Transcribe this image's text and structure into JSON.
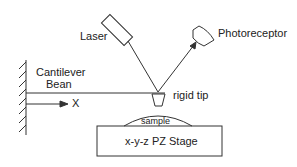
{
  "diagram": {
    "type": "Atomic force microscope schematic",
    "labels": {
      "laser": "Laser",
      "photoreceptor": "Photoreceptor",
      "cantilever_line1": "Cantilever",
      "cantilever_line2": "Bean",
      "x_axis": "X",
      "rigid_tip": "rigid tip",
      "sample": "sample",
      "stage": "x-y-z PZ Stage"
    },
    "colors": {
      "stroke": "#333333",
      "text": "#222222",
      "background": "#ffffff"
    }
  }
}
